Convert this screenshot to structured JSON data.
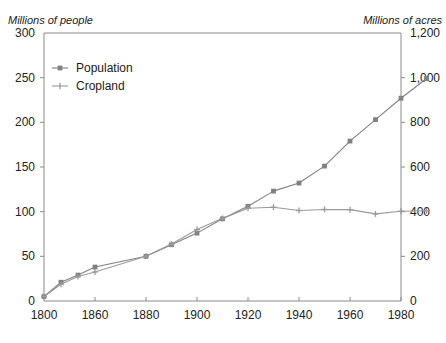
{
  "captions": {
    "left_axis": "Millions of people",
    "right_axis": "Millions of acres"
  },
  "chart_data": {
    "type": "line",
    "title": "",
    "subtitle": "",
    "xlabel": "",
    "ylabel": "Millions of people",
    "y2label": "Millions of acres",
    "grid": false,
    "legend_position": "top-left",
    "xlim": [
      1800,
      1990
    ],
    "ylim": [
      0,
      300
    ],
    "y2lim": [
      0,
      1200
    ],
    "xticks": [
      1800,
      1860,
      1880,
      1900,
      1920,
      1940,
      1960,
      1980
    ],
    "xtick_labels": [
      "1800",
      "1860",
      "1880",
      "1900",
      "1920",
      "1940",
      "1960",
      "1980"
    ],
    "yticks": [
      0,
      50,
      100,
      150,
      200,
      250,
      300
    ],
    "ytick_labels": [
      "0",
      "50",
      "100",
      "150",
      "200",
      "250",
      "300"
    ],
    "y2ticks": [
      0,
      200,
      400,
      600,
      800,
      1000,
      1200
    ],
    "y2tick_labels": [
      "0",
      "200",
      "400",
      "600",
      "800",
      "1,000",
      "1,200"
    ],
    "x": [
      1800,
      1820,
      1840,
      1860,
      1880,
      1900,
      1920,
      1940,
      1960,
      1980,
      1990
    ],
    "series": [
      {
        "name": "Population",
        "axis": "left",
        "color": "#808080",
        "marker": "square",
        "units": "millions of people",
        "x": [
          1800,
          1820,
          1840,
          1860,
          1880,
          1890,
          1900,
          1910,
          1920,
          1930,
          1940,
          1950,
          1960,
          1970,
          1980,
          1990
        ],
        "values": [
          5,
          21,
          29,
          38,
          50,
          63,
          76,
          92,
          106,
          123,
          132,
          151,
          179,
          203,
          227,
          249
        ]
      },
      {
        "name": "Cropland",
        "axis": "right",
        "color": "#9a9a9a",
        "marker": "plus",
        "units": "millions of acres",
        "x": [
          1800,
          1820,
          1840,
          1860,
          1880,
          1890,
          1900,
          1910,
          1920,
          1930,
          1940,
          1950,
          1960,
          1970,
          1980,
          1990
        ],
        "values": [
          20,
          75,
          110,
          130,
          200,
          255,
          320,
          370,
          415,
          420,
          405,
          410,
          409,
          390,
          402,
          404
        ]
      }
    ]
  },
  "legend": {
    "entries": [
      {
        "label": "Population"
      },
      {
        "label": "Cropland"
      }
    ]
  }
}
